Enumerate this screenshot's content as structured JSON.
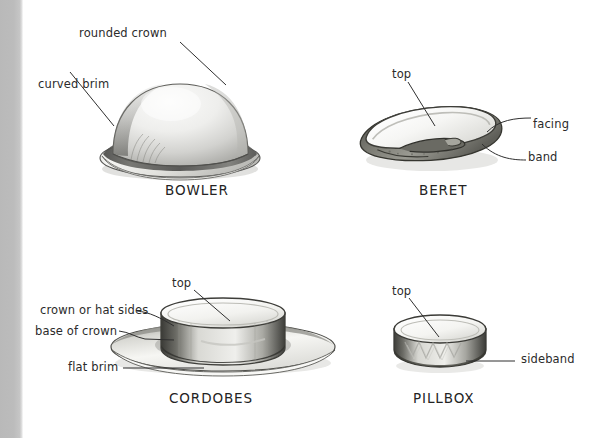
{
  "page": {
    "background_color": "#ffffff",
    "gutter_color": "#bcbcbc",
    "ink_color": "#2b2b2b",
    "width": 596,
    "height": 438
  },
  "figures": [
    {
      "id": "bowler",
      "caption": "BOWLER",
      "labels": [
        {
          "id": "rounded-crown",
          "text": "rounded crown"
        },
        {
          "id": "curved-brim",
          "text": "curved brim"
        }
      ]
    },
    {
      "id": "beret",
      "caption": "BERET",
      "labels": [
        {
          "id": "top",
          "text": "top"
        },
        {
          "id": "facing",
          "text": "facing"
        },
        {
          "id": "band",
          "text": "band"
        }
      ]
    },
    {
      "id": "cordobes",
      "caption": "CORDOBES",
      "labels": [
        {
          "id": "top",
          "text": "top"
        },
        {
          "id": "crown-or-hat-sides",
          "text": "crown or hat sides"
        },
        {
          "id": "base-of-crown",
          "text": "base of crown"
        },
        {
          "id": "flat-brim",
          "text": "flat brim"
        }
      ]
    },
    {
      "id": "pillbox",
      "caption": "PILLBOX",
      "labels": [
        {
          "id": "top",
          "text": "top"
        },
        {
          "id": "sideband",
          "text": "sideband"
        }
      ]
    }
  ]
}
